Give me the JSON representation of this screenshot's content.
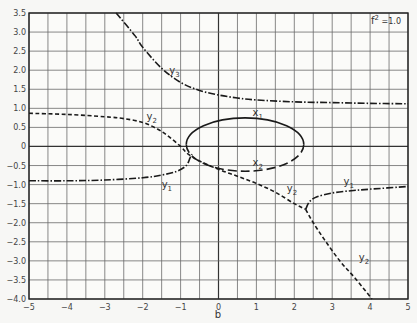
{
  "chart_data": {
    "type": "line",
    "title": "",
    "annotation": "f² = 1.0",
    "xlabel": "b",
    "ylabel": "",
    "xlim": [
      -5,
      5
    ],
    "ylim": [
      -4.0,
      3.5
    ],
    "grid": true,
    "grid_step_x": 0.5,
    "grid_step_y": 0.5,
    "xticks": [
      "-5",
      "-4",
      "-3",
      "-2",
      "-1",
      "0",
      "1",
      "2",
      "3",
      "4",
      "5"
    ],
    "yticks": [
      "3.5",
      "3.0",
      "2.5",
      "2.0",
      "1.5",
      "1.0",
      "0.5",
      "0",
      "-0.5",
      "-1.0",
      "-1.5",
      "-2.0",
      "-2.5",
      "-3.0",
      "-3.5",
      "-4.0"
    ],
    "series": [
      {
        "name": "y3",
        "style": "dash-dot",
        "points": [
          [
            -2.7,
            3.5
          ],
          [
            -2.2,
            2.9
          ],
          [
            -2.0,
            2.6
          ],
          [
            -1.5,
            2.05
          ],
          [
            -1.0,
            1.68
          ],
          [
            -0.5,
            1.47
          ],
          [
            0,
            1.35
          ],
          [
            0.5,
            1.27
          ],
          [
            1,
            1.22
          ],
          [
            2,
            1.17
          ],
          [
            3,
            1.15
          ],
          [
            4,
            1.13
          ],
          [
            5,
            1.12
          ]
        ]
      },
      {
        "name": "y2",
        "style": "dashed",
        "points": [
          [
            -5,
            0.87
          ],
          [
            -4,
            0.84
          ],
          [
            -3,
            0.78
          ],
          [
            -2.5,
            0.73
          ],
          [
            -2,
            0.63
          ],
          [
            -1.6,
            0.45
          ],
          [
            -1.3,
            0.25
          ],
          [
            -1.0,
            0.0
          ],
          [
            -0.8,
            -0.2
          ],
          [
            -0.5,
            -0.38
          ],
          [
            0,
            -0.6
          ],
          [
            0.5,
            -0.78
          ],
          [
            1,
            -0.97
          ],
          [
            1.5,
            -1.2
          ],
          [
            2.0,
            -1.5
          ],
          [
            2.3,
            -1.65
          ]
        ]
      },
      {
        "name": "y2 (lower branch)",
        "style": "dashed",
        "points": [
          [
            2.3,
            -1.65
          ],
          [
            2.5,
            -2.0
          ],
          [
            2.8,
            -2.45
          ],
          [
            3.2,
            -3.0
          ],
          [
            3.6,
            -3.45
          ],
          [
            4.05,
            -4.0
          ]
        ]
      },
      {
        "name": "y1",
        "style": "dash-dot",
        "points": [
          [
            -5,
            -0.9
          ],
          [
            -4,
            -0.9
          ],
          [
            -3,
            -0.88
          ],
          [
            -2,
            -0.82
          ],
          [
            -1.5,
            -0.75
          ],
          [
            -1.1,
            -0.65
          ],
          [
            -0.85,
            -0.5
          ],
          [
            -0.75,
            -0.3
          ],
          [
            -0.7,
            -0.2
          ]
        ]
      },
      {
        "name": "y1 (right branch)",
        "style": "dash-dot",
        "points": [
          [
            2.3,
            -1.65
          ],
          [
            2.4,
            -1.45
          ],
          [
            2.6,
            -1.32
          ],
          [
            3,
            -1.22
          ],
          [
            3.5,
            -1.16
          ],
          [
            4,
            -1.12
          ],
          [
            5,
            -1.05
          ]
        ]
      },
      {
        "name": "x1",
        "style": "solid",
        "shape": "upper half of closed loop",
        "center": [
          0.7,
          0.05
        ],
        "rx": 1.55,
        "ry": 0.7
      },
      {
        "name": "x2",
        "style": "long-dash",
        "shape": "lower half of closed loop",
        "center": [
          0.7,
          0.05
        ],
        "rx": 1.55,
        "ry": 0.7
      }
    ],
    "curve_labels": [
      {
        "text": "y3",
        "at": [
          -1.3,
          1.9
        ]
      },
      {
        "text": "y2",
        "at": [
          -1.9,
          0.7
        ]
      },
      {
        "text": "x1",
        "at": [
          0.9,
          0.8
        ]
      },
      {
        "text": "x2",
        "at": [
          0.9,
          -0.5
        ]
      },
      {
        "text": "y1",
        "at": [
          -1.5,
          -1.1
        ]
      },
      {
        "text": "y2",
        "at": [
          1.8,
          -1.2
        ]
      },
      {
        "text": "y1",
        "at": [
          3.3,
          -1.0
        ]
      },
      {
        "text": "y2",
        "at": [
          3.7,
          -3.0
        ]
      }
    ]
  },
  "labels": {
    "annotation_base": "f",
    "annotation_sup": "2",
    "annotation_rest": " =1.0",
    "xlabel": "b",
    "curve": {
      "y3": "y",
      "y3s": "3",
      "y2a": "y",
      "y2as": "2",
      "x1": "x",
      "x1s": "1",
      "x2": "x",
      "x2s": "2",
      "y1a": "y",
      "y1as": "1",
      "y2b": "y",
      "y2bs": "2",
      "y1b": "y",
      "y1bs": "1",
      "y2c": "y",
      "y2cs": "2"
    }
  }
}
